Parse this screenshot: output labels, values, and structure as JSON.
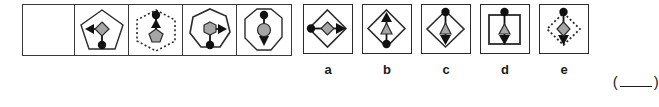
{
  "puzzle": {
    "type": "visual-analogy-matrix",
    "question_row": {
      "name": "question-sequence",
      "cells": [
        {
          "id": "cell-1",
          "label": "empty-missing-cell",
          "frame_shape": "none",
          "inner_shape": "none",
          "arrow": "none",
          "dot": "none",
          "empty": true
        },
        {
          "id": "cell-2",
          "label": "pentagon-diamond-left-arrow",
          "frame_shape": "pentagon",
          "frame_style": "solid",
          "inner_shape": "diamond",
          "inner_fill": "#a6a6a6",
          "arrow": "left",
          "dot": "bottom",
          "empty": false
        },
        {
          "id": "cell-3",
          "label": "hexagon-pentagon-up-arrow",
          "frame_shape": "hexagon",
          "frame_style": "dotted",
          "inner_shape": "pentagon",
          "inner_fill": "#a6a6a6",
          "arrow": "up",
          "dot": "top",
          "empty": false
        },
        {
          "id": "cell-4",
          "label": "heptagon-hexagon-right-arrow",
          "frame_shape": "heptagon",
          "frame_style": "solid",
          "inner_shape": "hexagon",
          "inner_fill": "#a6a6a6",
          "arrow": "right",
          "dot": "bottom",
          "empty": false
        },
        {
          "id": "cell-5",
          "label": "octagon-circle-down-arrow",
          "frame_shape": "octagon",
          "frame_style": "solid",
          "inner_shape": "circle",
          "inner_fill": "#a6a6a6",
          "arrow": "down",
          "dot": "top",
          "empty": false
        }
      ]
    },
    "options": [
      {
        "id": "option-a",
        "label": "a",
        "frame_shape": "diamond",
        "frame_style": "solid",
        "inner_shape": "diamond",
        "inner_fill": "#a6a6a6",
        "arrow": "right",
        "dot": "left"
      },
      {
        "id": "option-b",
        "label": "b",
        "frame_shape": "diamond",
        "frame_style": "solid",
        "inner_shape": "triangle-up",
        "inner_fill": "#a6a6a6",
        "arrow": "up",
        "dot": "bottom"
      },
      {
        "id": "option-c",
        "label": "c",
        "frame_shape": "diamond",
        "frame_style": "solid",
        "inner_shape": "triangle-up",
        "inner_fill": "#a6a6a6",
        "arrow": "down",
        "dot": "top"
      },
      {
        "id": "option-d",
        "label": "d",
        "frame_shape": "square",
        "frame_style": "solid",
        "inner_shape": "triangle-up",
        "inner_fill": "#a6a6a6",
        "arrow": "down",
        "dot": "top"
      },
      {
        "id": "option-e",
        "label": "e",
        "frame_shape": "diamond",
        "frame_style": "dotted",
        "inner_shape": "diamond",
        "inner_fill": "#a6a6a6",
        "arrow": "down",
        "dot": "top"
      }
    ],
    "answer_field": {
      "name": "answer-blank",
      "open_paren": "(",
      "close_paren": ")",
      "value": ""
    },
    "colors": {
      "stroke": "#2b2b2b",
      "frame_stroke": "#3a3a3a",
      "gray_fill": "#a6a6a6",
      "dot_fill": "#111111",
      "background": "#ffffff"
    }
  }
}
